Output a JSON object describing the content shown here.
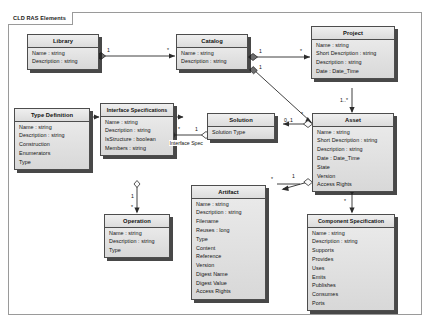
{
  "diagram": {
    "frame_label": "CLD RAS Elements",
    "type": "uml-class-diagram"
  },
  "classes": [
    {
      "id": "library",
      "name": "Library",
      "attributes": [
        "Name : string",
        "Description : string"
      ]
    },
    {
      "id": "catalog",
      "name": "Catalog",
      "attributes": [
        "Name : string",
        "Description : string"
      ]
    },
    {
      "id": "project",
      "name": "Project",
      "attributes": [
        "Name : string",
        "Short Description : string",
        "Description : string",
        "Date : Date_Time"
      ]
    },
    {
      "id": "type-definition",
      "name": "Type Definition",
      "attributes": [
        "Name : string",
        "Description : string",
        "Construction",
        "Enumerators",
        "Type"
      ]
    },
    {
      "id": "interface-specifications",
      "name": "Interface Specifications",
      "attributes": [
        "Name : string",
        "Description : string",
        "IsStructure : boolean",
        "Members : string"
      ]
    },
    {
      "id": "solution",
      "name": "Solution",
      "attributes": [
        "Solution Type"
      ]
    },
    {
      "id": "asset",
      "name": "Asset",
      "attributes": [
        "Name : string",
        "Short Description : string",
        "Description : string",
        "Date : Date_Time",
        "State",
        "Version",
        "Access Rights"
      ]
    },
    {
      "id": "operation",
      "name": "Operation",
      "attributes": [
        "Name : string",
        "Description : string",
        "Type"
      ]
    },
    {
      "id": "artifact",
      "name": "Artifact",
      "attributes": [
        "Name : string",
        "Description : string",
        "Filename",
        "Reuses : long",
        "Type",
        "Content",
        "Reference",
        "Version",
        "Digest Name",
        "Digest Value",
        "Access Rights"
      ]
    },
    {
      "id": "component-specification",
      "name": "Component Specification",
      "attributes": [
        "Name : string",
        "Description : string",
        "Supports",
        "Provides",
        "Uses",
        "Emits",
        "Publishes",
        "Consumes",
        "Ports"
      ]
    }
  ],
  "multiplicities": {
    "library_catalog_src": "1",
    "library_catalog_dst": "*",
    "catalog_project_src": "1",
    "catalog_project_dst": "*",
    "catalog_asset_src": "1",
    "catalog_asset_dst": "*",
    "project_asset": "1..*",
    "asset_solution": "0..1",
    "asset_artifact": "*",
    "asset_compspec": "*",
    "asset_interface_left": "1",
    "solution_interface_src": "1",
    "interface_solution_dst": "*",
    "interface_operation": "1",
    "operation_mult": "*",
    "typedef_mult": "*"
  },
  "edge_labels": {
    "interface_spec": "Interface Spec"
  },
  "colors": {
    "box_fill": "#e2e2e2",
    "box_border": "#4d4d4d",
    "line": "#2b2b2b",
    "frame": "#9a9a9a",
    "background": "#ffffff"
  }
}
